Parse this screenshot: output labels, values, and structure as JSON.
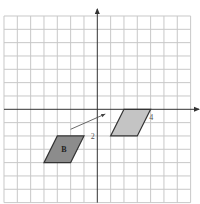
{
  "diagram": {
    "type": "coordinate-grid-translation",
    "grid": {
      "x_min": -7,
      "x_max": 7,
      "y_min": -7,
      "y_max": 7,
      "unit_px": 13.33,
      "origin_px": [
        97.3,
        109.3
      ],
      "line_color": "#c8c8c8",
      "axis_color": "#333333"
    },
    "shapes": [
      {
        "name": "shape-b",
        "label": "B",
        "vertices": [
          [
            -3,
            -2
          ],
          [
            -1,
            -2
          ],
          [
            -2,
            -4
          ],
          [
            -4,
            -4
          ]
        ],
        "fill": "#8c8c8c",
        "stroke": "#333333"
      },
      {
        "name": "shape-image",
        "label": "",
        "vertices": [
          [
            2,
            0
          ],
          [
            4,
            0
          ],
          [
            3,
            -2
          ],
          [
            1,
            -2
          ]
        ],
        "fill": "#c4c4c4",
        "stroke": "#333333"
      }
    ],
    "arrow": {
      "from": [
        -2,
        -1.5
      ],
      "to": [
        0.6,
        -0.35
      ],
      "color": "#444444"
    },
    "labels": [
      {
        "name": "label-2",
        "text": "2",
        "at": [
          -0.35,
          -2
        ]
      },
      {
        "name": "label-4",
        "text": "4",
        "at": [
          4.05,
          -0.55
        ]
      }
    ]
  }
}
